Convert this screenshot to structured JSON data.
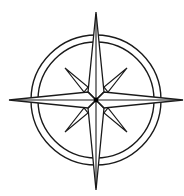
{
  "image": {
    "subject": "compass-rose",
    "description": "Eight-pointed compass rose inside a double ring, black line art on white",
    "colors": {
      "background": "#ffffff",
      "stroke": "#1a1a1a",
      "fill": "#ffffff",
      "center_dot": "#000000"
    },
    "cropped_text_remnant": ""
  }
}
